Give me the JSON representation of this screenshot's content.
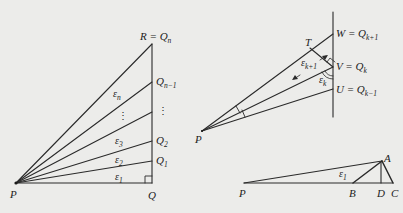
{
  "colors": {
    "background": "#ececea",
    "stroke": "#2a2a2a",
    "text": "#222222"
  },
  "diagrams": [
    {
      "name": "left-fan",
      "points": {
        "P": [
          16,
          183
        ],
        "Q": [
          152,
          183
        ],
        "R": [
          152,
          44
        ],
        "Q1": [
          152,
          161
        ],
        "Q2": [
          152,
          141
        ],
        "Qdots": [
          152,
          112
        ],
        "Qn_1": [
          152,
          82
        ]
      },
      "labels": {
        "R": "R = Q",
        "R_sub": "n",
        "Qn_1": "Q",
        "Qn_1_sub": "n−1",
        "dots_right": "⋮",
        "Q2": "Q",
        "Q2_sub": "2",
        "Q1": "Q",
        "Q1_sub": "1",
        "Q": "Q",
        "P": "P",
        "eps_n": "ε",
        "eps_n_sub": "n",
        "dots_mid": "⋮",
        "eps_3": "ε",
        "eps_3_sub": "3",
        "eps_2": "ε",
        "eps_2_sub": "2",
        "eps_1": "ε",
        "eps_1_sub": "1"
      }
    },
    {
      "name": "right-top-detail",
      "points": {
        "P": [
          202,
          131
        ],
        "W": [
          333,
          34
        ],
        "V": [
          333,
          67
        ],
        "U": [
          333,
          89
        ],
        "T": [
          310,
          48
        ],
        "line_top": [
          333,
          12
        ],
        "line_bottom": [
          333,
          117
        ]
      },
      "labels": {
        "W": "W = Q",
        "W_sub": "k+1",
        "V": "V = Q",
        "V_sub": "k",
        "U": "U = Q",
        "U_sub": "k−1",
        "T": "T",
        "eps_k1": "ε",
        "eps_k1_sub": "k+1",
        "eps_k": "ε",
        "eps_k_sub": "k",
        "P": "P"
      }
    },
    {
      "name": "right-bottom-triangle",
      "points": {
        "P": [
          244,
          183
        ],
        "A": [
          382,
          161
        ],
        "B": [
          353,
          183
        ],
        "D": [
          381,
          183
        ],
        "C": [
          393,
          183
        ]
      },
      "labels": {
        "P": "P",
        "A": "A",
        "B": "B",
        "D": "D",
        "C": "C",
        "eps_1": "ε",
        "eps_1_sub": "1"
      }
    }
  ]
}
